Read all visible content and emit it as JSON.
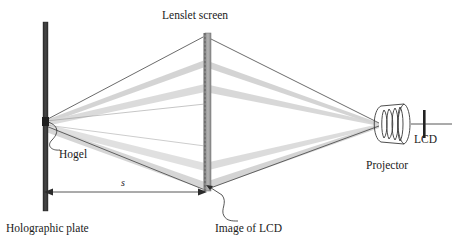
{
  "figure": {
    "background_color": "#ffffff"
  },
  "labels": {
    "lenslet_screen": "Lenslet screen",
    "hogel": "Hogel",
    "holographic_plate": "Holographic plate",
    "image_of_lcd": "Image of LCD",
    "projector": "Projector",
    "lcd": "LCD",
    "distance_s": "s"
  },
  "colors": {
    "plate": "#3f3f3f",
    "screen": "#9a9a9a",
    "beam_light": "#d6d6d6",
    "beam_mid": "#c2c2c2",
    "ray_line": "#2b2b2b",
    "text": "#1a1a1a",
    "lens_stroke": "#3a3a3a"
  },
  "geometry": {
    "holographic_plate": {
      "x": 43,
      "y_top": 22,
      "y_bottom": 211,
      "width": 5
    },
    "lenslet_screen": {
      "x": 205,
      "y_top": 33,
      "y_bottom": 191,
      "width": 6
    },
    "hogel_point": {
      "x": 46,
      "y": 121
    },
    "projector_aperture": {
      "x": 379,
      "y": 124
    },
    "dimension_s": {
      "x_start": 46,
      "x_end": 205,
      "y": 192
    },
    "lcd_bar": {
      "x": 424,
      "y_top": 110,
      "y_bottom": 138
    },
    "optical_axis": {
      "x_start": 424,
      "x_end": 452,
      "y": 124
    }
  },
  "elements": [
    {
      "name": "holographic-plate",
      "kind": "vertical-bar"
    },
    {
      "name": "lenslet-screen",
      "kind": "lenslet-array-bar"
    },
    {
      "name": "projector",
      "kind": "lens-barrel"
    },
    {
      "name": "lcd-panel",
      "kind": "vertical-bar"
    },
    {
      "name": "light-beams",
      "kind": "ray-bundle",
      "count": 4
    }
  ]
}
